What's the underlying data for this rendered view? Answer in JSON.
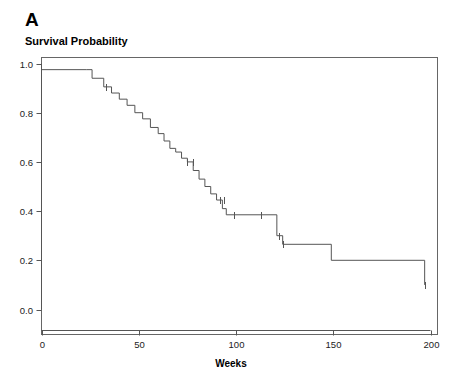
{
  "panel": {
    "label": "A"
  },
  "titles": {
    "plot_title": "Survival Probability",
    "x_axis": "Weeks"
  },
  "axes": {
    "y_ticks": [
      "0.0",
      "0.2",
      "0.4",
      "0.6",
      "0.8",
      "1.0"
    ],
    "x_ticks": [
      "0",
      "50",
      "100",
      "150",
      "200"
    ],
    "x_range": [
      0,
      200
    ],
    "y_range": [
      0.0,
      1.0
    ],
    "grid": "none",
    "frame": "box"
  },
  "colors": {
    "curve": "#555555",
    "axis": "#555555",
    "text": "#000000",
    "background": "#ffffff"
  },
  "chart_data": {
    "type": "line",
    "subtype": "kaplan-meier-step",
    "title": "Survival Probability",
    "xlabel": "Weeks",
    "ylabel": "Survival Probability",
    "xlim": [
      0,
      200
    ],
    "ylim": [
      0.0,
      1.0
    ],
    "grid": false,
    "legend": "none",
    "series": [
      {
        "name": "Overall survival",
        "step": "post",
        "x": [
          0,
          23,
          26,
          32,
          36,
          40,
          44,
          48,
          52,
          56,
          60,
          63,
          66,
          69,
          72,
          75,
          78,
          81,
          84,
          87,
          90,
          93,
          95,
          118,
          121,
          124,
          149,
          197
        ],
        "y": [
          0.975,
          0.975,
          0.94,
          0.905,
          0.88,
          0.855,
          0.83,
          0.8,
          0.775,
          0.74,
          0.715,
          0.685,
          0.655,
          0.64,
          0.615,
          0.6,
          0.565,
          0.53,
          0.5,
          0.47,
          0.445,
          0.41,
          0.385,
          0.385,
          0.3,
          0.265,
          0.2,
          0.1
        ],
        "censored_x": [
          33,
          75,
          78,
          92,
          94,
          99,
          113,
          122,
          124,
          197
        ],
        "censored_y": [
          0.905,
          0.6,
          0.6,
          0.445,
          0.445,
          0.385,
          0.385,
          0.3,
          0.265,
          0.1
        ]
      }
    ]
  }
}
